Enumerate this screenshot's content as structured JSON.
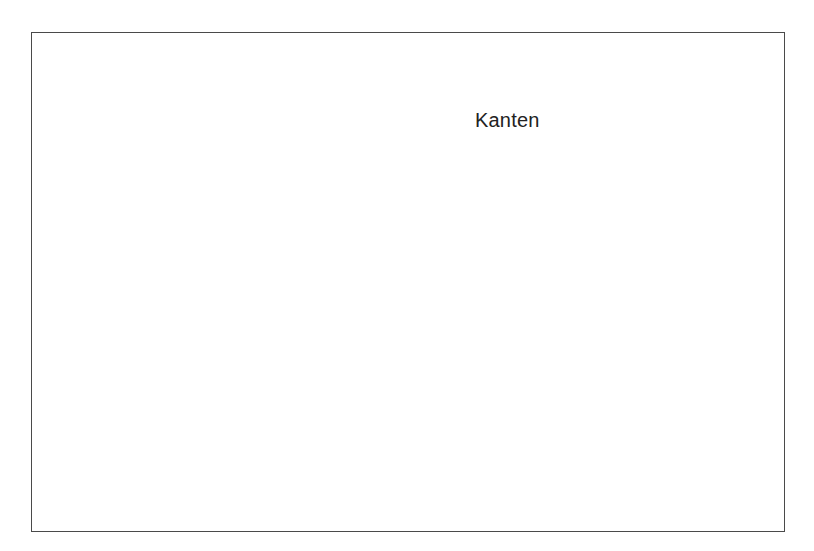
{
  "figure": {
    "background_color": "#ffffff",
    "frame": {
      "border_color": "#4a4a4a",
      "x": 31,
      "y": 32,
      "width": 754,
      "height": 500
    },
    "annotations": [
      {
        "name": "kanten-label",
        "text": "Kanten",
        "x": 475,
        "y": 109,
        "color": "#222222",
        "font_size": 20
      }
    ]
  },
  "chart_data": {
    "type": "line",
    "title": "",
    "subtitle": "",
    "xlabel": "",
    "ylabel": "",
    "grid": false,
    "legend": null,
    "annotations": [
      "Kanten"
    ],
    "panels": [
      {
        "name": "contour-curve",
        "type": "line",
        "description": "Closed contour / level-set curve (Kanten = edges) of a two-peak surface, drawn as a single thin outline.",
        "stroke_color": "#595959",
        "stroke_width": 1.05,
        "closed": true,
        "points": [
          [
            137,
            163
          ],
          [
            150,
            140
          ],
          [
            168,
            116
          ],
          [
            190,
            92
          ],
          [
            212,
            70
          ],
          [
            232,
            58
          ],
          [
            250,
            60
          ],
          [
            263,
            74
          ],
          [
            270,
            86
          ],
          [
            278,
            72
          ],
          [
            288,
            61
          ],
          [
            297,
            57
          ],
          [
            310,
            64
          ],
          [
            325,
            80
          ],
          [
            344,
            103
          ],
          [
            366,
            124
          ],
          [
            382,
            131
          ],
          [
            398,
            132
          ],
          [
            412,
            131
          ],
          [
            424,
            132
          ],
          [
            438,
            138
          ],
          [
            452,
            151
          ],
          [
            462,
            168
          ],
          [
            470,
            188
          ],
          [
            474,
            205
          ],
          [
            468,
            190
          ],
          [
            460,
            174
          ],
          [
            450,
            160
          ],
          [
            440,
            150
          ],
          [
            428,
            143
          ],
          [
            414,
            139
          ],
          [
            398,
            140
          ],
          [
            380,
            147
          ],
          [
            362,
            159
          ],
          [
            346,
            173
          ],
          [
            334,
            186
          ],
          [
            326,
            197
          ],
          [
            324,
            212
          ],
          [
            328,
            236
          ],
          [
            334,
            262
          ],
          [
            337,
            285
          ],
          [
            332,
            258
          ],
          [
            324,
            230
          ],
          [
            314,
            204
          ],
          [
            304,
            183
          ],
          [
            294,
            169
          ],
          [
            286,
            163
          ],
          [
            277,
            166
          ],
          [
            266,
            175
          ],
          [
            252,
            189
          ],
          [
            238,
            201
          ],
          [
            226,
            209
          ],
          [
            216,
            211
          ],
          [
            211,
            203
          ],
          [
            209,
            186
          ],
          [
            209,
            168
          ],
          [
            206,
            155
          ],
          [
            198,
            148
          ],
          [
            185,
            147
          ],
          [
            170,
            150
          ],
          [
            154,
            156
          ],
          [
            137,
            163
          ]
        ]
      },
      {
        "name": "wireframe-surface",
        "type": "surface",
        "description": "3D wireframe mesh (hidden-line removed) of a smooth function with two rounded peaks at the back and deep downward cusps at the front; drawn in an oblique/perspective projection.",
        "stroke_color": "#1a1a1a",
        "stroke_width": 0.85,
        "grid_u": 42,
        "grid_v": 42,
        "bounds_px": {
          "left": 366,
          "right": 697,
          "top": 262,
          "bottom": 522
        },
        "projection": {
          "origin_x": 530,
          "origin_y": 400,
          "u_axis": [
            -1.55,
            0.62
          ],
          "v_axis": [
            1.55,
            0.62
          ],
          "z_scale": -165
        },
        "peaks": [
          {
            "u": 0.3,
            "v": 0.33,
            "height": 1.0,
            "sigma": 0.185
          },
          {
            "u": 0.66,
            "v": 0.38,
            "height": 0.93,
            "sigma": 0.175
          }
        ],
        "troughs": [
          {
            "u": 0.5,
            "v": 0.85,
            "depth": 0.78,
            "sigma": 0.16
          },
          {
            "u": 0.13,
            "v": 0.78,
            "depth": 0.42,
            "sigma": 0.13
          }
        ]
      }
    ]
  }
}
